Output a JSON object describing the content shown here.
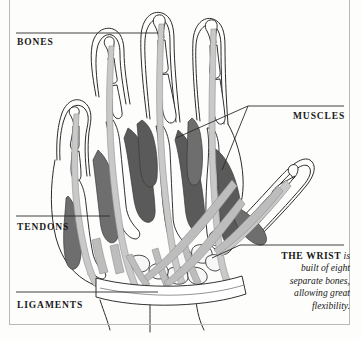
{
  "figure": {
    "background_color": "#fdfdfb",
    "frame_color": "#b9b9b4"
  },
  "labels": {
    "bones": "BONES",
    "tendons": "TENDONS",
    "ligaments": "LIGAMENTS",
    "muscles": "MUSCLES"
  },
  "caption": {
    "lead": "THE WRIST",
    "body": " is built of eight separate bones, allowing great flexibility."
  },
  "colors": {
    "outline": "#1a1a1a",
    "bone_fill": "#ffffff",
    "muscle_dark": "#5a5a5a",
    "muscle_mid": "#7d7d7d",
    "tendon_light": "#c9c9c9",
    "tendon_shade": "#b0b0b0",
    "skin_outline": "#2b2b2b",
    "leader_line": "#2b2b2b"
  }
}
